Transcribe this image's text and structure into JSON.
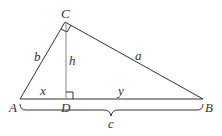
{
  "diagram": {
    "vertices": {
      "A": "A",
      "B": "B",
      "C": "C",
      "D": "D"
    },
    "sides": {
      "a": "a",
      "b": "b",
      "c": "c"
    },
    "segments": {
      "x": "x",
      "y": "y",
      "h": "h"
    },
    "colors": {
      "line": "#333333",
      "altitude": "#888888"
    }
  }
}
